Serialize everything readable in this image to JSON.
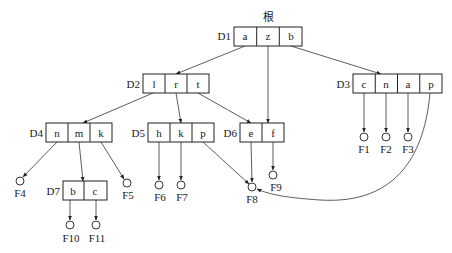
{
  "diagram": {
    "title": "根",
    "nodes": {
      "D1": {
        "label": "D1",
        "keys": [
          "a",
          "z",
          "b"
        ]
      },
      "D2": {
        "label": "D2",
        "keys": [
          "l",
          "r",
          "t"
        ]
      },
      "D3": {
        "label": "D3",
        "keys": [
          "c",
          "n",
          "a",
          "p"
        ]
      },
      "D4": {
        "label": "D4",
        "keys": [
          "n",
          "m",
          "k"
        ]
      },
      "D5": {
        "label": "D5",
        "keys": [
          "h",
          "k",
          "p"
        ]
      },
      "D6": {
        "label": "D6",
        "keys": [
          "e",
          "f"
        ]
      },
      "D7": {
        "label": "D7",
        "keys": [
          "b",
          "c"
        ]
      }
    },
    "leaves": {
      "F1": "F1",
      "F2": "F2",
      "F3": "F3",
      "F4": "F4",
      "F5": "F5",
      "F6": "F6",
      "F7": "F7",
      "F8": "F8",
      "F9": "F9",
      "F10": "F10",
      "F11": "F11"
    },
    "edges": [
      {
        "from": "D1.a",
        "to": "D2"
      },
      {
        "from": "D1.z",
        "to": "D6"
      },
      {
        "from": "D1.b",
        "to": "D3"
      },
      {
        "from": "D2.l",
        "to": "D4"
      },
      {
        "from": "D2.r",
        "to": "D5"
      },
      {
        "from": "D2.t",
        "to": "D6"
      },
      {
        "from": "D3.c",
        "to": "F1"
      },
      {
        "from": "D3.n",
        "to": "F2"
      },
      {
        "from": "D3.a",
        "to": "F3"
      },
      {
        "from": "D3.p",
        "to": "F8"
      },
      {
        "from": "D4.n",
        "to": "F4"
      },
      {
        "from": "D4.m",
        "to": "D7"
      },
      {
        "from": "D4.k",
        "to": "F5"
      },
      {
        "from": "D5.h",
        "to": "F6"
      },
      {
        "from": "D5.k",
        "to": "F7"
      },
      {
        "from": "D5.p",
        "to": "F8"
      },
      {
        "from": "D6.e",
        "to": "F8"
      },
      {
        "from": "D6.f",
        "to": "F9"
      },
      {
        "from": "D7.b",
        "to": "F10"
      },
      {
        "from": "D7.c",
        "to": "F11"
      }
    ]
  }
}
